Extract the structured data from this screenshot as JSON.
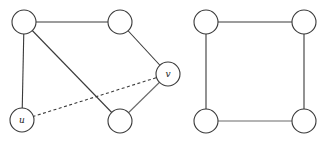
{
  "graphs": [
    {
      "name": "left-graph",
      "nodes": [
        {
          "id": "a",
          "label": "",
          "x": 24,
          "y": 22
        },
        {
          "id": "b",
          "label": "",
          "x": 120,
          "y": 22
        },
        {
          "id": "v",
          "label": "v",
          "x": 168,
          "y": 74
        },
        {
          "id": "c",
          "label": "",
          "x": 120,
          "y": 121
        },
        {
          "id": "u",
          "label": "u",
          "x": 22,
          "y": 120
        }
      ],
      "edges": [
        {
          "from": "a",
          "to": "b",
          "style": "solid"
        },
        {
          "from": "a",
          "to": "u",
          "style": "solid"
        },
        {
          "from": "a",
          "to": "c",
          "style": "solid"
        },
        {
          "from": "b",
          "to": "v",
          "style": "solid"
        },
        {
          "from": "v",
          "to": "c",
          "style": "solid-light"
        },
        {
          "from": "u",
          "to": "v",
          "style": "dashed"
        }
      ]
    },
    {
      "name": "right-graph",
      "nodes": [
        {
          "id": "p",
          "label": "",
          "x": 206,
          "y": 22
        },
        {
          "id": "q",
          "label": "",
          "x": 304,
          "y": 22
        },
        {
          "id": "r",
          "label": "",
          "x": 304,
          "y": 121
        },
        {
          "id": "s",
          "label": "",
          "x": 206,
          "y": 121
        }
      ],
      "edges": [
        {
          "from": "p",
          "to": "q",
          "style": "solid"
        },
        {
          "from": "q",
          "to": "r",
          "style": "solid"
        },
        {
          "from": "r",
          "to": "s",
          "style": "solid-light"
        },
        {
          "from": "s",
          "to": "p",
          "style": "solid"
        }
      ]
    }
  ],
  "node_radius": 12,
  "labels": {
    "u": "u",
    "v": "v"
  }
}
